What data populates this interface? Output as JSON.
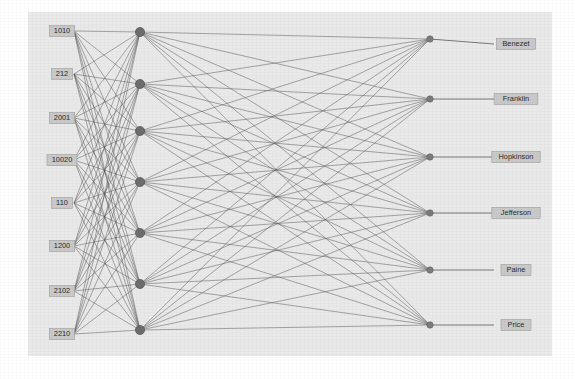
{
  "diagram": {
    "kind": "neural-network-graph",
    "title": "",
    "background_color": "#ffffff",
    "plot_area_color": "#e9e9e9",
    "plot_area": {
      "x": 28,
      "y": 12,
      "width": 524,
      "height": 344
    },
    "edge_color": "#5a5a5a",
    "node_color_hidden": "#6d6d6d",
    "node_color_output": "#7d7d7d",
    "label_box_color": "#c9c9c9",
    "label_text_color": "#2b2b2b",
    "layers": [
      {
        "name": "input-layer",
        "type": "input",
        "x": 62,
        "node_count": 8,
        "nodes": [
          {
            "label": "1010",
            "y": 31
          },
          {
            "label": "212",
            "y": 74
          },
          {
            "label": "2001",
            "y": 118
          },
          {
            "label": "10020",
            "y": 160
          },
          {
            "label": "110",
            "y": 203
          },
          {
            "label": "1200",
            "y": 246
          },
          {
            "label": "2102",
            "y": 291
          },
          {
            "label": "2210",
            "y": 334
          }
        ]
      },
      {
        "name": "hidden-layer-1",
        "type": "hidden",
        "x": 140,
        "node_count": 7,
        "nodes": [
          {
            "label": "",
            "y": 32
          },
          {
            "label": "",
            "y": 84
          },
          {
            "label": "",
            "y": 131
          },
          {
            "label": "",
            "y": 182
          },
          {
            "label": "",
            "y": 233
          },
          {
            "label": "",
            "y": 284
          },
          {
            "label": "",
            "y": 330
          }
        ]
      },
      {
        "name": "output-node-layer",
        "type": "hidden",
        "x": 430,
        "node_count": 6,
        "nodes": [
          {
            "label": "",
            "y": 39
          },
          {
            "label": "",
            "y": 99
          },
          {
            "label": "",
            "y": 157
          },
          {
            "label": "",
            "y": 213
          },
          {
            "label": "",
            "y": 270
          },
          {
            "label": "",
            "y": 325
          }
        ]
      },
      {
        "name": "output-label-layer",
        "type": "output",
        "x": 516,
        "node_count": 6,
        "nodes": [
          {
            "label": "Benezet",
            "y": 44
          },
          {
            "label": "Franklin",
            "y": 99
          },
          {
            "label": "Hopkinson",
            "y": 157
          },
          {
            "label": "Jefferson",
            "y": 213
          },
          {
            "label": "Paine",
            "y": 270
          },
          {
            "label": "Price",
            "y": 325
          }
        ]
      }
    ],
    "input_labels": [
      "1010",
      "212",
      "2001",
      "10020",
      "110",
      "1200",
      "2102",
      "2210"
    ],
    "output_labels": [
      "Benezet",
      "Franklin",
      "Hopkinson",
      "Jefferson",
      "Paine",
      "Price"
    ]
  }
}
